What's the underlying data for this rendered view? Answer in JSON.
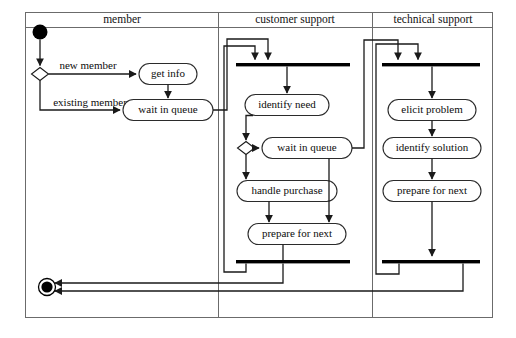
{
  "diagram": {
    "type": "uml-activity-diagram",
    "frame": {
      "x": 25,
      "y": 12,
      "width": 468,
      "height": 306
    },
    "header_separator_y": 27,
    "colors": {
      "frame_stroke": "#6b6b6b",
      "flow_stroke": "#1a1a1a",
      "node_stroke": "#2b2b2b",
      "node_fill": "#ffffff",
      "bar_fill": "#000000",
      "text": "#0d0d0d",
      "background": "#ffffff"
    },
    "lanes": [
      {
        "id": "member",
        "label": "member",
        "x": 25,
        "width": 193,
        "title_x": 122,
        "title_y": 20
      },
      {
        "id": "customer-support",
        "label": "customer support",
        "x": 218,
        "width": 154,
        "title_x": 295,
        "title_y": 20
      },
      {
        "id": "technical-support",
        "label": "technical support",
        "x": 372,
        "width": 121,
        "title_x": 433,
        "title_y": 20
      }
    ],
    "lane_dividers": [
      218,
      372
    ],
    "nodes": {
      "initial": {
        "name": "initial-node",
        "cx": 40,
        "cy": 32,
        "r": 7.5
      },
      "final": {
        "name": "final-node",
        "cx": 47,
        "cy": 287,
        "r_outer": 8.5,
        "r_inner": 5.5
      },
      "decision_member": {
        "name": "decision-member-type",
        "cx": 40,
        "cy": 74,
        "rx": 8.5,
        "ry": 6.5
      },
      "decision_cs": {
        "name": "decision-customer-support",
        "cx": 246,
        "cy": 148,
        "rx": 8.5,
        "ry": 6.5
      },
      "fork_cs": {
        "name": "fork-bar-customer-support",
        "x": 236,
        "y": 63,
        "width": 114,
        "height": 3.4
      },
      "join_cs": {
        "name": "join-bar-customer-support",
        "x": 236,
        "y": 260,
        "width": 114,
        "height": 3.4
      },
      "fork_ts": {
        "name": "fork-bar-technical-support",
        "x": 382,
        "y": 63,
        "width": 98,
        "height": 3.4
      },
      "join_ts": {
        "name": "join-bar-technical-support",
        "x": 382,
        "y": 260,
        "width": 98,
        "height": 3.4
      }
    },
    "actions": [
      {
        "id": "get-info",
        "label": "get info",
        "cx": 168,
        "cy": 74,
        "width": 58,
        "height": 21
      },
      {
        "id": "wait-in-queue-member",
        "label": "wait in queue",
        "cx": 168,
        "cy": 110,
        "width": 90,
        "height": 21
      },
      {
        "id": "identify-need",
        "label": "identify need",
        "cx": 287,
        "cy": 105,
        "width": 84,
        "height": 21
      },
      {
        "id": "wait-in-queue-cs",
        "label": "wait in queue",
        "cx": 307,
        "cy": 148,
        "width": 90,
        "height": 21
      },
      {
        "id": "handle-purchase",
        "label": "handle purchase",
        "cx": 287,
        "cy": 191,
        "width": 100,
        "height": 21
      },
      {
        "id": "prepare-for-next-cs",
        "label": "prepare for next",
        "cx": 297,
        "cy": 234,
        "width": 98,
        "height": 21
      },
      {
        "id": "elicit-problem",
        "label": "elicit problem",
        "cx": 432,
        "cy": 110,
        "width": 88,
        "height": 21
      },
      {
        "id": "identify-solution",
        "label": "identify solution",
        "cx": 432,
        "cy": 148,
        "width": 98,
        "height": 21
      },
      {
        "id": "prepare-for-next-ts",
        "label": "prepare for next",
        "cx": 432,
        "cy": 191,
        "width": 98,
        "height": 21
      }
    ],
    "edge_labels": [
      {
        "id": "new-member",
        "label": "new member",
        "x": 88,
        "y": 66
      },
      {
        "id": "existing-member",
        "label": "existing member",
        "x": 90,
        "y": 103
      }
    ]
  }
}
